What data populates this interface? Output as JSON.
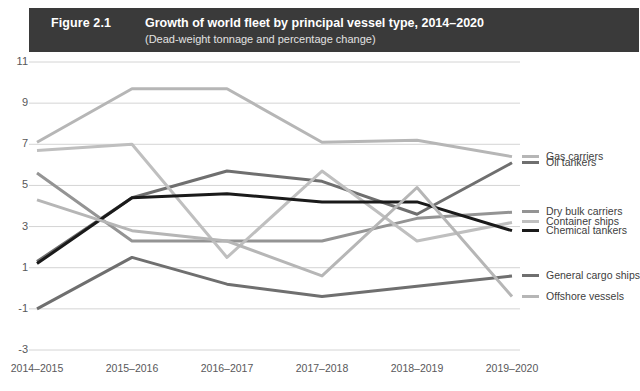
{
  "banner": {
    "figure_number": "Figure 2.1",
    "title": "Growth of world fleet by principal vessel type, 2014–2020",
    "subtitle": "(Dead-weight tonnage and percentage change)",
    "background_color": "#3a3a3a",
    "text_color": "#ffffff"
  },
  "chart_data": {
    "type": "line",
    "title": "Growth of world fleet by principal vessel type, 2014–2020",
    "subtitle": "(Dead-weight tonnage and percentage change)",
    "xlabel": "",
    "ylabel": "",
    "categories": [
      "2014–2015",
      "2015–2016",
      "2016–2017",
      "2017–2018",
      "2018–2019",
      "2019–2020"
    ],
    "ylim": [
      -3,
      11
    ],
    "yticks": [
      11,
      9,
      7,
      5,
      3,
      1,
      -1,
      -3
    ],
    "grid": true,
    "legend_position": "right",
    "series": [
      {
        "name": "Gas carriers",
        "color": "#b6b6b6",
        "values": [
          7.1,
          9.7,
          9.7,
          7.1,
          7.2,
          6.4
        ]
      },
      {
        "name": "Oil tankers",
        "color": "#6f6f6f",
        "values": [
          1.3,
          4.4,
          5.7,
          5.2,
          3.6,
          6.1
        ]
      },
      {
        "name": "Dry bulk carriers",
        "color": "#949494",
        "values": [
          5.6,
          2.3,
          2.3,
          2.3,
          3.4,
          3.7
        ]
      },
      {
        "name": "Container ships",
        "color": "#bfbfbf",
        "values": [
          6.7,
          7.0,
          1.5,
          5.7,
          2.3,
          3.2
        ]
      },
      {
        "name": "Chemical tankers",
        "color": "#1a1a1a",
        "values": [
          1.2,
          4.4,
          4.6,
          4.2,
          4.2,
          2.8
        ]
      },
      {
        "name": "General cargo ships",
        "color": "#6f6f6f",
        "values": [
          -1.0,
          1.5,
          0.2,
          -0.4,
          0.1,
          0.6
        ]
      },
      {
        "name": "Offshore vessels",
        "color": "#b6b6b6",
        "values": [
          4.3,
          2.8,
          2.3,
          0.6,
          4.9,
          -0.4
        ]
      }
    ]
  }
}
